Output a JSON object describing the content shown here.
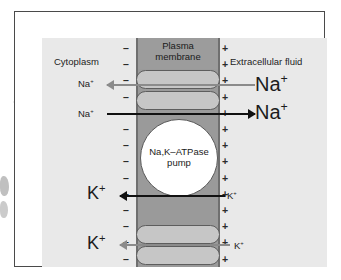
{
  "figure": {
    "compartments": {
      "left_label": "Cytoplasm",
      "right_label": "Extracellular fluid",
      "membrane_label_line1": "Plasma",
      "membrane_label_line2": "membrane"
    },
    "pump": {
      "line1": "Na,K–ATPase",
      "line2": "pump"
    },
    "ions": {
      "na_cytoplasm_out": "Na",
      "na_cytoplasm_in": "Na",
      "na_extracellular_top": "Na",
      "na_extracellular_bottom": "Na",
      "k_cytoplasm_mid": "K",
      "k_extracellular_mid": "K",
      "k_cytoplasm_bottom": "K",
      "k_extracellular_bottom": "K",
      "superscript_plus": "+"
    },
    "charges": {
      "inner_symbol": "–",
      "outer_symbol": "+",
      "inner_count": 14,
      "outer_count": 14
    },
    "colors": {
      "page": "#ffffff",
      "panel_background": "#e9e9e9",
      "membrane": "#9a9a9a",
      "lipid_capsule": "#c6c6c6",
      "pump_fill": "#ffffff",
      "frame_border": "#4a4a4a",
      "arrow_dark": "#111111",
      "arrow_gray": "#8b8b8b",
      "text": "#1c1c1c"
    },
    "arrows": [
      {
        "name": "na-efflux-to-cytoplasm",
        "direction": "left",
        "style": "gray"
      },
      {
        "name": "na-out-of-cell",
        "direction": "right",
        "style": "dark"
      },
      {
        "name": "k-into-cytoplasm",
        "direction": "left",
        "style": "dark"
      },
      {
        "name": "k-into-cytoplasm-lower",
        "direction": "left",
        "style": "gray"
      }
    ]
  }
}
